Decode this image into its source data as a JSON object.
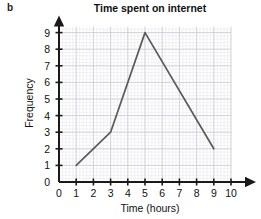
{
  "part_label": "b",
  "chart_data": {
    "type": "line",
    "title": "Time spent on internet",
    "xlabel": "Time (hours)",
    "ylabel": "Frequency",
    "x": [
      1,
      3,
      5,
      9
    ],
    "values": [
      1,
      3,
      9,
      2
    ],
    "points": [
      {
        "x": 1,
        "y": 1
      },
      {
        "x": 3,
        "y": 3
      },
      {
        "x": 5,
        "y": 9
      },
      {
        "x": 9,
        "y": 2
      }
    ],
    "xlim": [
      0,
      10
    ],
    "ylim": [
      0,
      9
    ],
    "xticks": [
      0,
      1,
      2,
      3,
      4,
      5,
      6,
      7,
      8,
      9,
      10
    ],
    "yticks": [
      0,
      1,
      2,
      3,
      4,
      5,
      6,
      7,
      8,
      9
    ],
    "xtick_labels": [
      "0",
      "1",
      "2",
      "3",
      "4",
      "5",
      "6",
      "7",
      "8",
      "9",
      "10"
    ],
    "ytick_labels": [
      "0",
      "1",
      "2",
      "3",
      "4",
      "5",
      "6",
      "7",
      "8",
      "9"
    ],
    "grid": true,
    "grid_minor_per_major": 5,
    "legend": null,
    "line_color": "#5a5a5a",
    "grid_major_color": "#c7c7cf",
    "grid_minor_color": "#e4e4ea",
    "axis_color": "#1a1a1a",
    "axis_arrows": true
  }
}
